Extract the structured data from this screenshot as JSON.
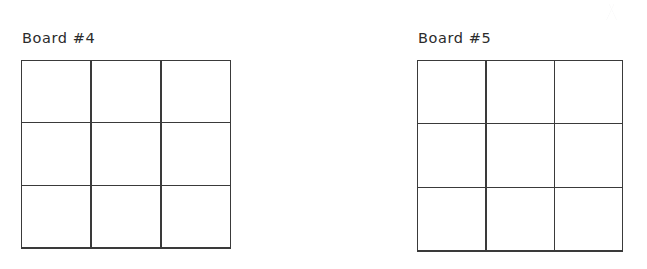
{
  "page": {
    "background_color": "#ffffff",
    "line_color": "#3a3a3a",
    "text_color": "#2b2b2b",
    "width": 647,
    "height": 269
  },
  "boards": [
    {
      "label": "Board #4",
      "rows": 3,
      "columns": 3,
      "cells": [
        [
          "",
          "",
          ""
        ],
        [
          "",
          "",
          ""
        ],
        [
          "",
          "",
          ""
        ]
      ]
    },
    {
      "label": "Board #5",
      "rows": 3,
      "columns": 3,
      "cells": [
        [
          "",
          "",
          ""
        ],
        [
          "",
          "",
          ""
        ],
        [
          "",
          "",
          ""
        ]
      ]
    }
  ]
}
